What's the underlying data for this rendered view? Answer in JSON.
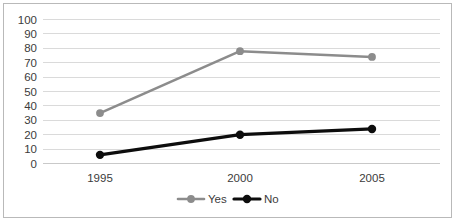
{
  "chart_data": {
    "type": "line",
    "title": "",
    "xlabel": "",
    "ylabel": "",
    "categories": [
      "1995",
      "2000",
      "2005"
    ],
    "series": [
      {
        "name": "Yes",
        "values": [
          35,
          78,
          74
        ],
        "color": "#8c8c8c"
      },
      {
        "name": "No",
        "values": [
          6,
          20,
          24
        ],
        "color": "#0d0d0d"
      }
    ],
    "ylim": [
      0,
      100
    ],
    "ystep": 10,
    "yticks": [
      "0",
      "10",
      "20",
      "30",
      "40",
      "50",
      "60",
      "70",
      "80",
      "90",
      "100"
    ],
    "grid": true,
    "legend_position": "bottom",
    "marker": "circle",
    "colors": {
      "gridline": "#d6d6d6",
      "axis_text": "#3b3b3b",
      "border": "#b9b9b9",
      "background": "#ffffff"
    }
  },
  "legend": {
    "items": [
      {
        "label": "Yes",
        "color": "#8c8c8c"
      },
      {
        "label": "No",
        "color": "#0d0d0d"
      }
    ]
  }
}
